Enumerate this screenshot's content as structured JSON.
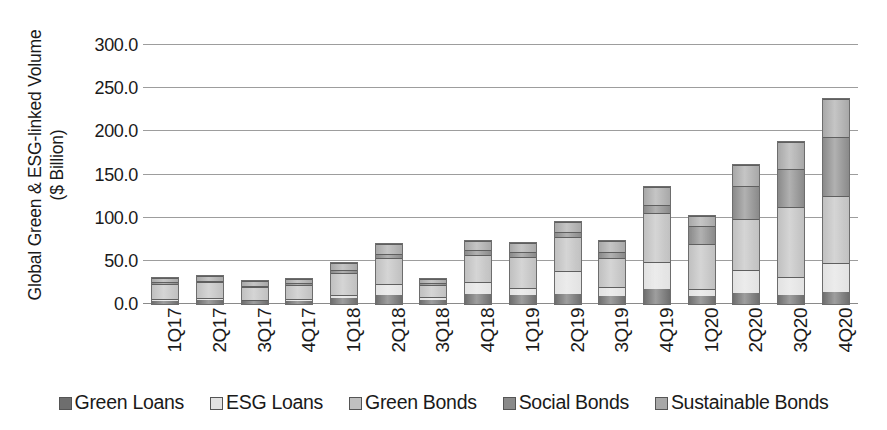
{
  "chart_data": {
    "type": "bar",
    "stacked": true,
    "title": "",
    "xlabel": "",
    "ylabel": "Global Green & ESG-linked Volume ($ Billion)",
    "ylabel_line1": "Global Green & ESG-linked Volume",
    "ylabel_line2": "($ Billion)",
    "ylim": [
      0,
      300
    ],
    "ytick_step": 50,
    "grid": "horizontal",
    "legend_position": "bottom",
    "categories": [
      "1Q17",
      "2Q17",
      "3Q17",
      "4Q17",
      "1Q18",
      "2Q18",
      "3Q18",
      "4Q18",
      "1Q19",
      "2Q19",
      "3Q19",
      "4Q19",
      "1Q20",
      "2Q20",
      "3Q20",
      "4Q20"
    ],
    "ytick_labels": [
      "0.0",
      "50.0",
      "100.0",
      "150.0",
      "200.0",
      "250.0",
      "300.0"
    ],
    "ytick_values": [
      0,
      50,
      100,
      150,
      200,
      250,
      300
    ],
    "series": [
      {
        "name": "Green Loans",
        "color": "#6e6e6e",
        "values": [
          4,
          5,
          3,
          4,
          7,
          11,
          5,
          12,
          10,
          12,
          9,
          17,
          9,
          13,
          11,
          14
        ]
      },
      {
        "name": "ESG Loans",
        "color": "#e2e2e2",
        "values": [
          2,
          2,
          1,
          2,
          4,
          12,
          3,
          13,
          9,
          26,
          11,
          32,
          8,
          26,
          20,
          33
        ]
      },
      {
        "name": "Green Bonds",
        "color": "#c0c0c0",
        "values": [
          17,
          18,
          15,
          16,
          25,
          30,
          14,
          32,
          35,
          40,
          33,
          57,
          52,
          60,
          81,
          78
        ]
      },
      {
        "name": "Social Bonds",
        "color": "#8a8a8a",
        "values": [
          2,
          2,
          2,
          2,
          3,
          5,
          2,
          6,
          6,
          6,
          7,
          9,
          21,
          38,
          44,
          68
        ]
      },
      {
        "name": "Sustainable Bonds",
        "color": "#a8a8a8",
        "values": [
          5,
          5,
          5,
          5,
          8,
          12,
          5,
          10,
          11,
          11,
          13,
          20,
          12,
          24,
          32,
          44
        ]
      }
    ],
    "totals": [
      30,
      32,
      26,
      29,
      47,
      70,
      29,
      73,
      71,
      95,
      73,
      135,
      102,
      161,
      188,
      237
    ]
  },
  "legend": {
    "items": [
      {
        "label": "Green Loans"
      },
      {
        "label": "ESG Loans"
      },
      {
        "label": "Green Bonds"
      },
      {
        "label": "Social Bonds"
      },
      {
        "label": "Sustainable Bonds"
      }
    ]
  },
  "colors": {
    "gridline": "#9d9d9d",
    "axis": "#8a8a8a",
    "text": "#1a1a1a",
    "background": "#ffffff"
  }
}
